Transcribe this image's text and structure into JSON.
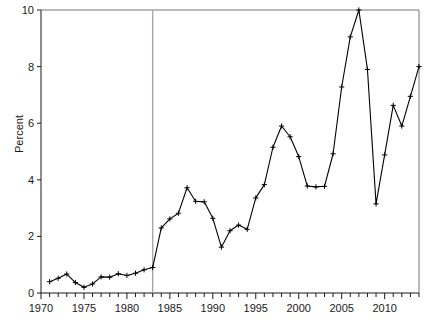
{
  "chart_data": {
    "type": "line",
    "title": "",
    "xlabel": "",
    "ylabel": "Percent",
    "xlim": [
      1970,
      2014
    ],
    "ylim": [
      0,
      10
    ],
    "ytick_values": [
      0,
      2,
      4,
      6,
      8,
      10
    ],
    "ytick_labels": [
      "0",
      "2",
      "4",
      "6",
      "8",
      "10"
    ],
    "xtick_values": [
      1970,
      1975,
      1980,
      1985,
      1990,
      1995,
      2000,
      2005,
      2010
    ],
    "xtick_labels": [
      "1970",
      "1975",
      "1980",
      "1985",
      "1990",
      "1995",
      "2000",
      "2005",
      "2010"
    ],
    "minor_xtick_interval": 1,
    "grid": false,
    "legend": "none",
    "marker": "plus",
    "line_color": "#000000",
    "annotations": [
      {
        "name": "reference-line",
        "type": "vline",
        "x": 1983,
        "color": "#a8a8a8"
      }
    ],
    "x": [
      1971,
      1972,
      1973,
      1974,
      1975,
      1976,
      1977,
      1978,
      1979,
      1980,
      1981,
      1982,
      1983,
      1984,
      1985,
      1986,
      1987,
      1988,
      1989,
      1990,
      1991,
      1992,
      1993,
      1994,
      1995,
      1996,
      1997,
      1998,
      1999,
      2000,
      2001,
      2002,
      2003,
      2004,
      2005,
      2006,
      2007,
      2008,
      2009,
      2010,
      2011,
      2012,
      2013,
      2014
    ],
    "values": [
      0.4,
      0.52,
      0.67,
      0.37,
      0.2,
      0.32,
      0.57,
      0.56,
      0.68,
      0.62,
      0.7,
      0.82,
      0.9,
      2.3,
      2.62,
      2.82,
      3.72,
      3.24,
      3.22,
      2.64,
      1.62,
      2.2,
      2.4,
      2.25,
      3.36,
      3.83,
      5.15,
      5.9,
      5.52,
      4.82,
      3.78,
      3.75,
      3.77,
      4.92,
      7.28,
      9.05,
      10.0,
      7.9,
      3.15,
      4.88,
      6.63,
      5.9,
      6.95,
      8.0
    ],
    "series": [
      {
        "name": "percent-series",
        "values": [
          0.4,
          0.52,
          0.67,
          0.37,
          0.2,
          0.32,
          0.57,
          0.56,
          0.68,
          0.62,
          0.7,
          0.82,
          0.9,
          2.3,
          2.62,
          2.82,
          3.72,
          3.24,
          3.22,
          2.64,
          1.62,
          2.2,
          2.4,
          2.25,
          3.36,
          3.83,
          5.15,
          5.9,
          5.52,
          4.82,
          3.78,
          3.75,
          3.77,
          4.92,
          7.28,
          9.05,
          10.0,
          7.9,
          3.15,
          4.88,
          6.63,
          5.9,
          6.95,
          8.0
        ]
      }
    ]
  }
}
